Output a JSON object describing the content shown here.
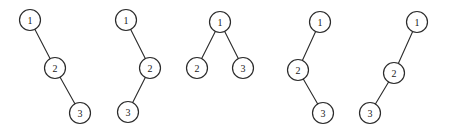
{
  "figure": {
    "width": 449,
    "height": 136,
    "background_color": "#ffffff",
    "stroke_color": "#2b2b2b",
    "label_color": "#1a1a1a",
    "node_radius": 10.5,
    "node_fill": "#ffffff"
  },
  "chart_data": {
    "type": "diagram",
    "title": "",
    "subtitle": "",
    "xlabel": "",
    "ylabel": "",
    "legend": [],
    "annotations": [],
    "trees": [
      {
        "name": "tree-1",
        "shape": "right-right-chain",
        "nodes": [
          {
            "id": "t1n1",
            "label": "1",
            "x": 30,
            "y": 20
          },
          {
            "id": "t1n2",
            "label": "2",
            "x": 55,
            "y": 68
          },
          {
            "id": "t1n3",
            "label": "3",
            "x": 80,
            "y": 113
          }
        ],
        "edges": [
          {
            "from": "t1n1",
            "to": "t1n2"
          },
          {
            "from": "t1n2",
            "to": "t1n3"
          }
        ]
      },
      {
        "name": "tree-2",
        "shape": "right-left-chain",
        "nodes": [
          {
            "id": "t2n1",
            "label": "1",
            "x": 126,
            "y": 20
          },
          {
            "id": "t2n2",
            "label": "2",
            "x": 150,
            "y": 68
          },
          {
            "id": "t2n3",
            "label": "3",
            "x": 128,
            "y": 112
          }
        ],
        "edges": [
          {
            "from": "t2n1",
            "to": "t2n2"
          },
          {
            "from": "t2n2",
            "to": "t2n3"
          }
        ]
      },
      {
        "name": "tree-3",
        "shape": "balanced-two-children",
        "nodes": [
          {
            "id": "t3n1",
            "label": "1",
            "x": 220,
            "y": 22
          },
          {
            "id": "t3n2",
            "label": "2",
            "x": 197,
            "y": 68
          },
          {
            "id": "t3n3",
            "label": "3",
            "x": 243,
            "y": 68
          }
        ],
        "edges": [
          {
            "from": "t3n1",
            "to": "t3n2"
          },
          {
            "from": "t3n1",
            "to": "t3n3"
          }
        ]
      },
      {
        "name": "tree-4",
        "shape": "left-right-chain",
        "nodes": [
          {
            "id": "t4n1",
            "label": "1",
            "x": 320,
            "y": 22
          },
          {
            "id": "t4n2",
            "label": "2",
            "x": 298,
            "y": 70
          },
          {
            "id": "t4n3",
            "label": "3",
            "x": 323,
            "y": 113
          }
        ],
        "edges": [
          {
            "from": "t4n1",
            "to": "t4n2"
          },
          {
            "from": "t4n2",
            "to": "t4n3"
          }
        ]
      },
      {
        "name": "tree-5",
        "shape": "left-left-chain",
        "nodes": [
          {
            "id": "t5n1",
            "label": "1",
            "x": 417,
            "y": 22
          },
          {
            "id": "t5n2",
            "label": "2",
            "x": 394,
            "y": 73
          },
          {
            "id": "t5n3",
            "label": "3",
            "x": 370,
            "y": 113
          }
        ],
        "edges": [
          {
            "from": "t5n1",
            "to": "t5n2"
          },
          {
            "from": "t5n2",
            "to": "t5n3"
          }
        ]
      }
    ]
  }
}
